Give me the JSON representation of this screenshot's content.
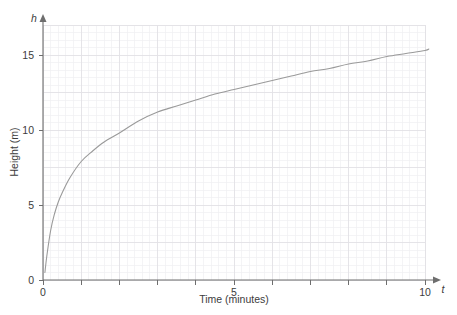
{
  "figure": {
    "top_cut_text": "",
    "axis_color": "#6e6e6e",
    "curve_color": "#9a9a9a",
    "grid_minor_color": "#f0eff2",
    "grid_major_color": "#e2e1e6",
    "background": "#ffffff"
  },
  "chart_data": {
    "type": "line",
    "title": "",
    "xlabel": "Time (minutes)",
    "ylabel": "Height (m)",
    "x_var": "t",
    "y_var": "h",
    "xlim": [
      0,
      10.5
    ],
    "ylim": [
      0,
      17
    ],
    "xticks": [
      0,
      1,
      2,
      3,
      4,
      5,
      6,
      7,
      8,
      9,
      10
    ],
    "xtick_labels": [
      "0",
      "",
      "",
      "",
      "",
      "5",
      "",
      "",
      "",
      "",
      "10"
    ],
    "yticks": [
      0,
      5,
      10,
      15
    ],
    "ytick_labels": [
      "0",
      "5",
      "10",
      "15"
    ],
    "grid": "minor and major gridlines shown, light gray",
    "legend": "none",
    "series": [
      {
        "name": "Height vs time",
        "x": [
          0.05,
          0.1,
          0.2,
          0.3,
          0.4,
          0.5,
          0.7,
          1.0,
          1.3,
          1.6,
          2.0,
          2.5,
          3.0,
          3.5,
          4.0,
          4.5,
          5.0,
          5.5,
          6.0,
          6.5,
          7.0,
          7.5,
          8.0,
          8.5,
          9.0,
          9.5,
          10.0,
          10.1
        ],
        "y": [
          0.5,
          1.6,
          3.3,
          4.4,
          5.2,
          5.8,
          6.8,
          7.9,
          8.6,
          9.2,
          9.8,
          10.6,
          11.2,
          11.6,
          12.0,
          12.4,
          12.7,
          13.0,
          13.3,
          13.6,
          13.9,
          14.1,
          14.4,
          14.6,
          14.9,
          15.1,
          15.3,
          15.4
        ]
      }
    ]
  }
}
